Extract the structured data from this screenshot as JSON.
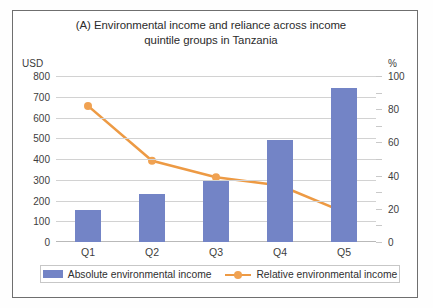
{
  "figure": {
    "title": "(A) Environmental income and reliance across income quintile groups in Tanzania",
    "title_line1": "(A) Environmental income and reliance across income",
    "title_line2": "quintile groups in Tanzania",
    "left_unit": "USD",
    "right_unit": "%",
    "bar_color": "#7384c6",
    "line_color": "#ed9a44",
    "marker_color": "#f0a252",
    "gridline_color": "#d2d2d2"
  },
  "legend": {
    "items": [
      {
        "label": "Absolute environmental income",
        "type": "bar",
        "color": "#7384c6"
      },
      {
        "label": "Relative environmental income",
        "type": "line",
        "color": "#ed9a44"
      }
    ]
  },
  "axes": {
    "left_ticks": [
      "800",
      "700",
      "600",
      "500",
      "400",
      "300",
      "200",
      "100",
      "0"
    ],
    "right_ticks": [
      "100",
      "80",
      "60",
      "40",
      "20",
      "0"
    ],
    "x_ticks": [
      "Q1",
      "Q2",
      "Q3",
      "Q4",
      "Q5"
    ]
  },
  "chart_data": {
    "type": "bar",
    "title": "(A) Environmental income and reliance across income quintile groups in Tanzania",
    "xlabel": "",
    "ylabel": "USD",
    "y2label": "%",
    "categories": [
      "Q1",
      "Q2",
      "Q3",
      "Q4",
      "Q5"
    ],
    "ylim": [
      0,
      800
    ],
    "y2lim": [
      0,
      100
    ],
    "ytick_step": 100,
    "y2tick_step": 20,
    "grid": true,
    "legend_position": "bottom",
    "series": [
      {
        "name": "Absolute environmental income",
        "type": "bar",
        "axis": "left",
        "unit": "USD",
        "color": "#7384c6",
        "values": [
          155,
          230,
          295,
          490,
          740
        ]
      },
      {
        "name": "Relative environmental income",
        "type": "line",
        "axis": "right",
        "unit": "%",
        "color": "#ed9a44",
        "values": [
          82,
          49,
          39,
          34,
          18
        ]
      }
    ]
  }
}
